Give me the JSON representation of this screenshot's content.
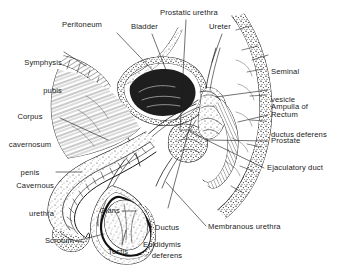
{
  "figure": {
    "kind": "anatomical-illustration",
    "style": "black-and-white stippled line engraving",
    "background_color": "#ffffff",
    "ink_color": "#1a1a1a",
    "width": 344,
    "height": 271
  },
  "labels": {
    "peritoneum": "Peritoneum",
    "bladder": "Bladder",
    "prostatic_urethra": "Prostatic urethra",
    "ureter": "Ureter",
    "symphysis_1": "Symphysis",
    "symphysis_2": "pubis",
    "corpus_1": "Corpus",
    "corpus_2": "cavernosum",
    "corpus_3": "penis",
    "cavernous_1": "Cavernous",
    "cavernous_2": "urethra",
    "glans": "Glans",
    "scrotum": "Scrotum",
    "testis": "Testis",
    "seminal_1": "Seminal",
    "seminal_2": "vesicle",
    "ampulla_1": "Ampulla of",
    "ampulla_2": "ductus deferens",
    "rectum": "Rectum",
    "prostate": "Prostate",
    "ejaculatory_duct": "Ejaculatory duct",
    "ductus_1": "Ductus",
    "ductus_2": "deferens",
    "epididymis": "Epididymis",
    "membranous_urethra": "Membranous urethra"
  }
}
